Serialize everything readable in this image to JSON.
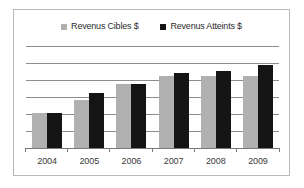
{
  "chart_data": {
    "type": "bar",
    "title": "",
    "subtitle": "",
    "xlabel": "",
    "ylabel": "",
    "categories": [
      "2004",
      "2005",
      "2006",
      "2007",
      "2008",
      "2009"
    ],
    "series": [
      {
        "name": "Revenus Cibles $",
        "color": "#b0b0b0",
        "marker": "gray-square",
        "values": [
          35,
          48,
          64,
          72,
          72,
          72
        ]
      },
      {
        "name": "Revenus Atteints $",
        "color": "#141414",
        "marker": "black-square",
        "values": [
          35,
          55,
          64,
          75,
          77,
          83
        ]
      }
    ],
    "ylim": [
      0,
      102
    ],
    "gridlines": [
      17,
      34,
      51,
      68,
      85,
      102
    ],
    "grid": true,
    "legend_position": "top-center",
    "axis_ticks_visible": true,
    "y_axis_labels_visible": false
  },
  "frame": {
    "border_color": "#b9b9b9",
    "background": "#ffffff"
  }
}
